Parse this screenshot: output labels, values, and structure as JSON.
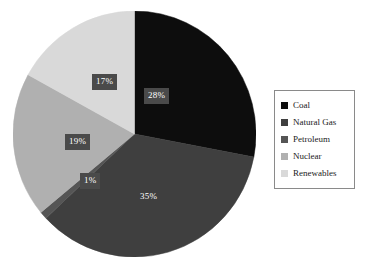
{
  "chart_data": {
    "type": "pie",
    "title": "",
    "subtitle": "",
    "xlabel": "",
    "ylabel": "",
    "grid": false,
    "legend_position": "right",
    "start_angle_deg": 0,
    "direction": "clockwise",
    "categories": [
      "Coal",
      "Natural Gas",
      "Petroleum",
      "Nuclear",
      "Renewables"
    ],
    "values": [
      28,
      35,
      1,
      19,
      17
    ],
    "value_unit": "%",
    "data_labels": [
      "28%",
      "35%",
      "1%",
      "19%",
      "17%"
    ],
    "colors": [
      "#0d0d0d",
      "#3f3f3f",
      "#555555",
      "#b0b0b0",
      "#d9d9d9"
    ],
    "slices": [
      {
        "name": "Coal",
        "value": 28,
        "label": "28%",
        "color": "#0d0d0d"
      },
      {
        "name": "Natural Gas",
        "value": 35,
        "label": "35%",
        "color": "#3f3f3f"
      },
      {
        "name": "Petroleum",
        "value": 1,
        "label": "1%",
        "color": "#555555"
      },
      {
        "name": "Nuclear",
        "value": 19,
        "label": "19%",
        "color": "#b0b0b0"
      },
      {
        "name": "Renewables",
        "value": 17,
        "label": "17%",
        "color": "#d9d9d9"
      }
    ]
  },
  "legend": {
    "items": [
      {
        "label": "Coal",
        "color": "#0d0d0d"
      },
      {
        "label": "Natural Gas",
        "color": "#3f3f3f"
      },
      {
        "label": "Petroleum",
        "color": "#555555"
      },
      {
        "label": "Nuclear",
        "color": "#b0b0b0"
      },
      {
        "label": "Renewables",
        "color": "#d9d9d9"
      }
    ]
  },
  "style": {
    "background": "#ffffff",
    "label_box_fill": "#4a4a4a",
    "label_text": "#ffffff",
    "legend_border": "#8a8a8a"
  }
}
